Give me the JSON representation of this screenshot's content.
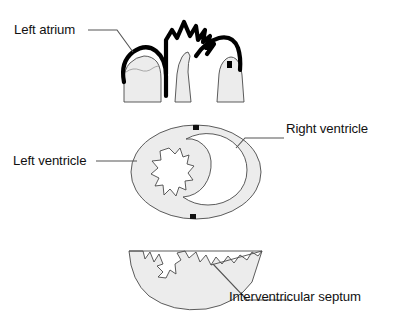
{
  "figure": {
    "type": "anatomical-line-diagram",
    "background_color": "#ffffff",
    "outline_color": "#333333",
    "heavy_outline_color": "#000000",
    "fill_color": "#ececec",
    "leader_line_color": "#555555",
    "text_color": "#111111"
  },
  "labels": {
    "left_atrium": "Left atrium",
    "right_ventricle": "Right ventricle",
    "left_ventricle": "Left ventricle",
    "interventricular_septum": "Interventricular septum"
  },
  "panels": [
    {
      "id": "top",
      "name": "longitudinal-section",
      "description": "Three muscle-band segments with heavy black atrial arch and crown-shaped zigzag",
      "label_refs": [
        "left_atrium"
      ]
    },
    {
      "id": "middle",
      "name": "transverse-section",
      "description": "Oval cross-section of ventricles showing left and right chambers",
      "label_refs": [
        "left_ventricle",
        "right_ventricle"
      ]
    },
    {
      "id": "bottom",
      "name": "apical-section",
      "description": "Half-dome bowl section with jagged superior border",
      "label_refs": [
        "interventricular_septum"
      ]
    }
  ]
}
